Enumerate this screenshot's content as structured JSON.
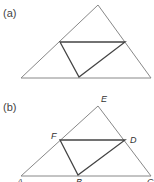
{
  "panels": [
    {
      "label": "(a)",
      "outer_triangle": [
        [
          21,
          78
        ],
        [
          98,
          5
        ],
        [
          151,
          78
        ]
      ],
      "inner_triangle": [
        [
          60,
          42
        ],
        [
          125,
          42
        ],
        [
          79,
          77
        ]
      ],
      "points": []
    },
    {
      "label": "(b)",
      "outer_triangle": [
        [
          21,
          176
        ],
        [
          98,
          106
        ],
        [
          151,
          176
        ]
      ],
      "inner_triangle": [
        [
          60,
          140
        ],
        [
          125,
          140
        ],
        [
          78,
          175
        ]
      ],
      "points": [
        {
          "name": "E",
          "x": 103,
          "y": 96
        },
        {
          "name": "F",
          "x": 52,
          "y": 132
        },
        {
          "name": "D",
          "x": 131,
          "y": 136
        },
        {
          "name": "A",
          "x": 18,
          "y": 178
        },
        {
          "name": "B",
          "x": 77,
          "y": 178
        },
        {
          "name": "C",
          "x": 148,
          "y": 178
        }
      ]
    }
  ],
  "colors": {
    "outer_stroke": "#888888",
    "inner_stroke": "#444444"
  }
}
